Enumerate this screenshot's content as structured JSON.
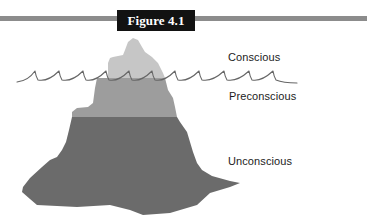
{
  "figure": {
    "label": "Figure 4.1",
    "rule_color": "#8c8c8c",
    "label_bg": "#121212"
  },
  "diagram": {
    "layers": [
      {
        "name": "Conscious",
        "color": "#c6c6c6"
      },
      {
        "name": "Preconscious",
        "color": "#9d9d9d"
      },
      {
        "name": "Unconscious",
        "color": "#6b6b6b"
      }
    ],
    "waterline_color": "#666666"
  }
}
